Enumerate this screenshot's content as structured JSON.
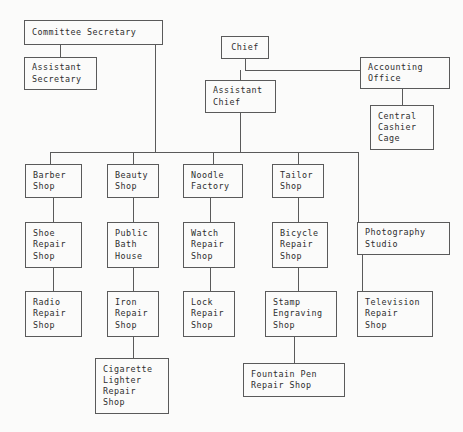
{
  "chart_data": {
    "type": "diagram",
    "diagram_kind": "org-chart",
    "background_color": "#fbfbfa",
    "line_color": "#5a5a5a",
    "text_color": "#2e2e2e",
    "canvas": {
      "width": 463,
      "height": 432
    },
    "nodes": [
      {
        "id": "committee_secretary",
        "label": "Committee Secretary",
        "lines": [
          "Committee Secretary"
        ],
        "x": 24,
        "y": 20,
        "w": 139,
        "h": 25
      },
      {
        "id": "assistant_secretary",
        "label": "Assistant Secretary",
        "lines": [
          "Assistant",
          "Secretary"
        ],
        "x": 24,
        "y": 57,
        "w": 73,
        "h": 33
      },
      {
        "id": "chief",
        "label": "Chief",
        "lines": [
          "Chief"
        ],
        "x": 221,
        "y": 36,
        "w": 48,
        "h": 23
      },
      {
        "id": "accounting_office",
        "label": "Accounting Office",
        "lines": [
          "Accounting",
          "Office"
        ],
        "x": 360,
        "y": 57,
        "w": 90,
        "h": 32
      },
      {
        "id": "assistant_chief",
        "label": "Assistant Chief",
        "lines": [
          "Assistant",
          "Chief"
        ],
        "x": 205,
        "y": 80,
        "w": 71,
        "h": 33
      },
      {
        "id": "central_cashier_cage",
        "label": "Central Cashier Cage",
        "lines": [
          "Central",
          "Cashier",
          "Cage"
        ],
        "x": 370,
        "y": 105,
        "w": 64,
        "h": 45
      },
      {
        "id": "barber_shop",
        "label": "Barber Shop",
        "lines": [
          "Barber",
          "Shop"
        ],
        "x": 25,
        "y": 164,
        "w": 57,
        "h": 34
      },
      {
        "id": "beauty_shop",
        "label": "Beauty Shop",
        "lines": [
          "Beauty",
          "Shop"
        ],
        "x": 107,
        "y": 164,
        "w": 52,
        "h": 34
      },
      {
        "id": "noodle_factory",
        "label": "Noodle Factory",
        "lines": [
          "Noodle",
          "Factory"
        ],
        "x": 183,
        "y": 164,
        "w": 60,
        "h": 34
      },
      {
        "id": "tailor_shop",
        "label": "Tailor Shop",
        "lines": [
          "Tailor",
          "Shop"
        ],
        "x": 272,
        "y": 164,
        "w": 52,
        "h": 34
      },
      {
        "id": "shoe_repair_shop",
        "label": "Shoe Repair Shop",
        "lines": [
          "Shoe",
          "Repair",
          "Shop"
        ],
        "x": 25,
        "y": 222,
        "w": 57,
        "h": 46
      },
      {
        "id": "public_bath_house",
        "label": "Public Bath House",
        "lines": [
          "Public",
          "Bath",
          "House"
        ],
        "x": 107,
        "y": 222,
        "w": 52,
        "h": 46
      },
      {
        "id": "watch_repair_shop",
        "label": "Watch Repair Shop",
        "lines": [
          "Watch",
          "Repair",
          "Shop"
        ],
        "x": 183,
        "y": 222,
        "w": 52,
        "h": 46
      },
      {
        "id": "bicycle_repair_shop",
        "label": "Bicycle Repair Shop",
        "lines": [
          "Bicycle",
          "Repair",
          "Shop"
        ],
        "x": 272,
        "y": 222,
        "w": 56,
        "h": 46
      },
      {
        "id": "photography_studio",
        "label": "Photography Studio",
        "lines": [
          "Photography",
          "Studio"
        ],
        "x": 357,
        "y": 222,
        "w": 93,
        "h": 33
      },
      {
        "id": "radio_repair_shop",
        "label": "Radio Repair Shop",
        "lines": [
          "Radio",
          "Repair",
          "Shop"
        ],
        "x": 25,
        "y": 291,
        "w": 57,
        "h": 46
      },
      {
        "id": "iron_repair_shop",
        "label": "Iron Repair Shop",
        "lines": [
          "Iron",
          "Repair",
          "Shop"
        ],
        "x": 107,
        "y": 291,
        "w": 52,
        "h": 46
      },
      {
        "id": "lock_repair_shop",
        "label": "Lock Repair Shop",
        "lines": [
          "Lock",
          "Repair",
          "Shop"
        ],
        "x": 183,
        "y": 291,
        "w": 52,
        "h": 46
      },
      {
        "id": "stamp_engraving_shop",
        "label": "Stamp Engraving Shop",
        "lines": [
          "Stamp",
          "Engraving",
          "Shop"
        ],
        "x": 265,
        "y": 291,
        "w": 72,
        "h": 46
      },
      {
        "id": "television_repair_shop",
        "label": "Television Repair Shop",
        "lines": [
          "Television",
          "Repair",
          "Shop"
        ],
        "x": 357,
        "y": 291,
        "w": 76,
        "h": 46
      },
      {
        "id": "cigarette_lighter_repair_shop",
        "label": "Cigarette Lighter Repair Shop",
        "lines": [
          "Cigarette",
          "Lighter",
          "Repair",
          "Shop"
        ],
        "x": 95,
        "y": 358,
        "w": 74,
        "h": 56
      },
      {
        "id": "fountain_pen_repair_shop",
        "label": "Fountain Pen Repair Shop",
        "lines": [
          "Fountain Pen",
          "Repair Shop"
        ],
        "x": 243,
        "y": 363,
        "w": 102,
        "h": 34
      }
    ],
    "edges": [
      {
        "from": "committee_secretary",
        "to": "assistant_secretary",
        "points": "60,45 60,57"
      },
      {
        "from": "committee_secretary",
        "to": "department_bus",
        "points": "155,45 155,152"
      },
      {
        "from": "chief",
        "to": "chief_bus",
        "points": "245,59 245,70"
      },
      {
        "from": "chief_bus",
        "to": "accounting_office",
        "points": "245,70 405,70 405,57"
      },
      {
        "from": "chief_bus",
        "to": "assistant_chief",
        "points": "240,70 240,80"
      },
      {
        "from": "accounting_office",
        "to": "central_cashier_cage",
        "points": "402,89 402,105"
      },
      {
        "from": "assistant_chief",
        "to": "department_bus",
        "points": "240,113 240,152"
      },
      {
        "from": "department_bus",
        "to": "bus_line",
        "points": "50,152 358,152"
      },
      {
        "from": "department_bus",
        "to": "barber_shop",
        "points": "50,152 50,164"
      },
      {
        "from": "department_bus",
        "to": "beauty_shop",
        "points": "133,152 133,164"
      },
      {
        "from": "department_bus",
        "to": "noodle_factory",
        "points": "213,152 213,164"
      },
      {
        "from": "department_bus",
        "to": "tailor_shop",
        "points": "298,152 298,164"
      },
      {
        "from": "department_bus",
        "to": "photography_studio",
        "points": "358,152 358,222"
      },
      {
        "from": "barber_shop",
        "to": "shoe_repair_shop",
        "points": "53,198 53,222"
      },
      {
        "from": "beauty_shop",
        "to": "public_bath_house",
        "points": "133,198 133,222"
      },
      {
        "from": "noodle_factory",
        "to": "watch_repair_shop",
        "points": "210,198 210,222"
      },
      {
        "from": "tailor_shop",
        "to": "bicycle_repair_shop",
        "points": "298,198 298,222"
      },
      {
        "from": "shoe_repair_shop",
        "to": "radio_repair_shop",
        "points": "53,268 53,291"
      },
      {
        "from": "public_bath_house",
        "to": "iron_repair_shop",
        "points": "133,268 133,291"
      },
      {
        "from": "watch_repair_shop",
        "to": "lock_repair_shop",
        "points": "210,268 210,291"
      },
      {
        "from": "bicycle_repair_shop",
        "to": "stamp_engraving_shop",
        "points": "298,268 298,291"
      },
      {
        "from": "photography_studio",
        "to": "television_repair_shop",
        "points": "362,255 362,291"
      },
      {
        "from": "iron_repair_shop",
        "to": "cigarette_lighter_repair_shop",
        "points": "133,337 133,358"
      },
      {
        "from": "stamp_engraving_shop",
        "to": "fountain_pen_repair_shop",
        "points": "294,337 294,363"
      }
    ]
  }
}
